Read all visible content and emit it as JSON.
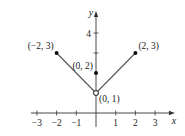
{
  "chart_data": {
    "type": "line",
    "title": "",
    "xlabel": "x",
    "ylabel": "y",
    "xlim": [
      -3.2,
      3.6
    ],
    "ylim": [
      -0.7,
      4.8
    ],
    "x_ticks": [
      -3,
      -2,
      -1,
      1,
      2,
      3
    ],
    "x_tick_labels": [
      "−3",
      "−2",
      "−1",
      "1",
      "2",
      "3"
    ],
    "y_ticks": [
      3,
      4
    ],
    "y_tick_labels": [
      "",
      "4"
    ],
    "grid": false,
    "series": [
      {
        "name": "left-branch",
        "points": [
          [
            -2,
            3
          ],
          [
            0,
            1
          ]
        ],
        "start_marker": "filled",
        "end_marker": "open"
      },
      {
        "name": "right-branch",
        "points": [
          [
            0,
            1
          ],
          [
            2,
            3
          ]
        ],
        "start_marker": "open",
        "end_marker": "filled"
      }
    ],
    "isolated_points": [
      {
        "x": 0,
        "y": 2,
        "marker": "filled"
      }
    ],
    "annotations": [
      {
        "text": "(−2, 3)",
        "x": -2,
        "y": 3,
        "position": "upper-left"
      },
      {
        "text": "(0, 2)",
        "x": 0,
        "y": 2,
        "position": "upper-left"
      },
      {
        "text": "(2, 3)",
        "x": 2,
        "y": 3,
        "position": "upper-right"
      },
      {
        "text": "(0, 1)",
        "x": 0,
        "y": 1,
        "position": "lower-right"
      }
    ]
  }
}
